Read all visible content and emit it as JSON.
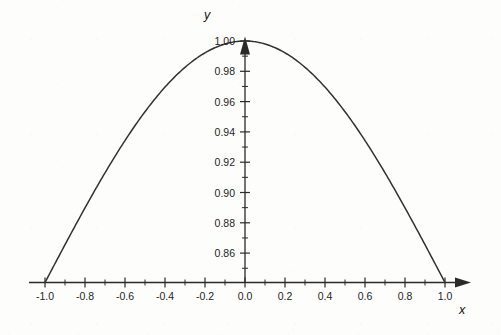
{
  "chart_data": {
    "type": "line",
    "title": "",
    "xlabel": "x",
    "ylabel": "y",
    "xlim": [
      -1.08,
      1.12
    ],
    "ylim": [
      0.8406,
      1.007
    ],
    "grid": false,
    "legend": null,
    "x_ticks": [
      "-1.0",
      "-0.8",
      "-0.6",
      "-0.4",
      "-0.2",
      "0.0",
      "0.2",
      "0.4",
      "0.6",
      "0.8",
      "1.0"
    ],
    "x_tick_values": [
      -1.0,
      -0.8,
      -0.6,
      -0.4,
      -0.2,
      0.0,
      0.2,
      0.4,
      0.6,
      0.8,
      1.0
    ],
    "x_minor_step": 0.1,
    "y_ticks": [
      "0.86",
      "0.88",
      "0.90",
      "0.92",
      "0.94",
      "0.96",
      "0.98",
      "1.00"
    ],
    "y_tick_values": [
      0.86,
      0.88,
      0.9,
      0.92,
      0.94,
      0.96,
      0.98,
      1.0
    ],
    "y_minor_step": 0.01,
    "series": [
      {
        "name": "curve",
        "color": "#33312f",
        "x": [
          -1.0,
          -0.95,
          -0.9,
          -0.85,
          -0.8,
          -0.75,
          -0.7,
          -0.65,
          -0.6,
          -0.55,
          -0.5,
          -0.45,
          -0.4,
          -0.35,
          -0.3,
          -0.25,
          -0.2,
          -0.15,
          -0.1,
          -0.05,
          0.0,
          0.05,
          0.1,
          0.15,
          0.2,
          0.25,
          0.3,
          0.35,
          0.4,
          0.45,
          0.5,
          0.55,
          0.6,
          0.65,
          0.7,
          0.75,
          0.8,
          0.85,
          0.9,
          0.95,
          1.0
        ],
        "y": [
          0.8406,
          0.8445,
          0.8561,
          0.8752,
          0.9013,
          0.9338,
          0.9716,
          1.0135,
          1.0577,
          1.1023,
          1.1451,
          1.1838,
          1.2163,
          1.2405,
          1.2552,
          1.2594,
          1.2531,
          1.2369,
          1.2122,
          1.1809,
          1.1453,
          1.1083,
          1.0724,
          1.0399,
          1.0126,
          0.9916,
          0.9773,
          0.9694,
          0.967,
          0.9687,
          0.973,
          0.9783,
          0.983,
          0.9862,
          0.9873,
          0.9862,
          0.983,
          0.9783,
          0.973,
          0.9687,
          0.8406
        ]
      }
    ],
    "curve_description": "smooth concave-down arc peaking at 1.00 at x = 0 and meeting the x-axis at x = -1.0 and x = 1.0",
    "peak": {
      "x": 0.0,
      "y": 1.0
    },
    "roots": [
      -1.0,
      1.0
    ]
  },
  "axes": {
    "x_title": "x",
    "y_title": "y"
  }
}
